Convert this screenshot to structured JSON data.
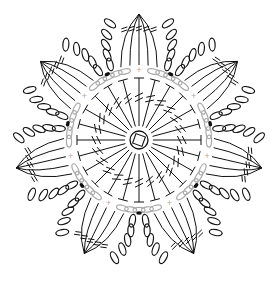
{
  "diagram": {
    "type": "crochet-chart",
    "center": {
      "x": 139,
      "y": 140
    },
    "colors": {
      "stitch": "#111111",
      "chain_round": "#aaaaaa",
      "background": "#ffffff"
    },
    "magic_ring": {
      "radius": 9
    },
    "round1": {
      "stitch": "treble (dc with double slash)",
      "count": 24,
      "inner_r": 14,
      "outer_r": 62
    },
    "round2": {
      "stitch": "chain loops",
      "color": "#aaaaaa",
      "radius": 70,
      "loops": 7
    },
    "petals": {
      "count": 7,
      "start_angle_deg": -90,
      "inner_r": 75,
      "outer_r": 130,
      "half_width_deg": 20,
      "chains_per_side": 5,
      "long_stitches": 5
    },
    "markers": {
      "type": "dot",
      "note": "join points between petals"
    }
  }
}
